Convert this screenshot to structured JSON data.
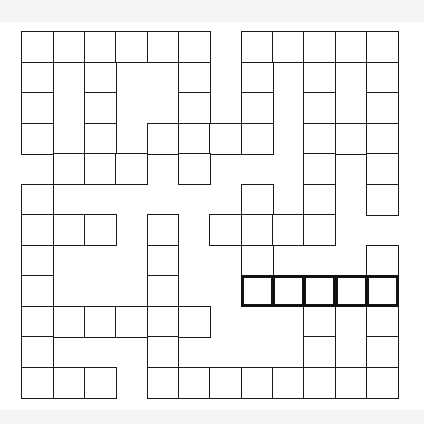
{
  "puzzle": {
    "type": "crossword-grid",
    "rows": 12,
    "cols": 12,
    "cell_width": 31.35,
    "cell_height": 30.5,
    "legend": {
      "0": "blank",
      "1": "cell",
      "2": "highlighted-entry-cell"
    },
    "grid": [
      "111111011111",
      "101001010101",
      "101001010101",
      "101011110111",
      "011101000101",
      "100000010101",
      "111010111100",
      "100010010001",
      "100010022222",
      "111111000101",
      "100010000101",
      "111011111111"
    ],
    "highlighted_entry": {
      "row": 8,
      "start_col": 7,
      "length": 5,
      "direction": "across"
    },
    "colors": {
      "line": "#1a1a1a",
      "cell_bg": "#ffffff",
      "strip_bg": "#f4f4f4"
    }
  }
}
